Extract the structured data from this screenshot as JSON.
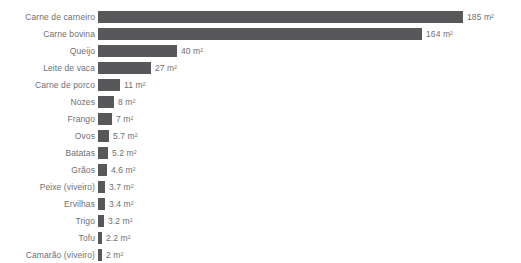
{
  "chart_data": {
    "type": "bar",
    "orientation": "horizontal",
    "title": "",
    "subtitle": "",
    "xlabel": "",
    "ylabel": "",
    "unit": "m²",
    "grid": false,
    "legend": false,
    "xlim": [
      0,
      185
    ],
    "bar_color": "#58585a",
    "text_color": "#6f6f72",
    "background": "#ffffff",
    "categories": [
      "Carne de carneiro",
      "Carne bovina",
      "Queijo",
      "Leite de vaca",
      "Carne de porco",
      "Nozes",
      "Frango",
      "Ovos",
      "Batatas",
      "Grãos",
      "Peixe (viveiro)",
      "Ervilhas",
      "Trigo",
      "Tofu",
      "Camarão (viveiro)"
    ],
    "values": [
      185,
      164,
      40,
      27,
      11,
      8,
      7,
      5.7,
      5.2,
      4.6,
      3.7,
      3.4,
      3.2,
      2.2,
      2
    ],
    "value_labels": [
      "185 m²",
      "164 m²",
      "40 m²",
      "27 m²",
      "11 m²",
      "8 m²",
      "7 m²",
      "5.7 m²",
      "5.2 m²",
      "4.6 m²",
      "3.7 m²",
      "3.4 m²",
      "3.2 m²",
      "2.2 m²",
      "2 m²"
    ]
  }
}
